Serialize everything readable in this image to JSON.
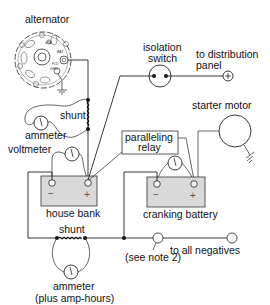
{
  "diagram": {
    "type": "electrical-wiring",
    "colors": {
      "wire": "#222222",
      "battery_fill": "#d9d9d9",
      "background": "#ffffff"
    },
    "labels": {
      "alternator": "alternator",
      "shunt_top": "shunt",
      "ammeter_top": "ammeter",
      "voltmeter": "voltmeter",
      "isolation_switch_1": "isolation",
      "isolation_switch_2": "switch",
      "distribution_1": "to distribution",
      "distribution_2": "panel",
      "starter_motor": "starter motor",
      "relay_1": "paralleling",
      "relay_2": "relay",
      "house_bank": "house bank",
      "cranking_battery": "cranking battery",
      "shunt_bottom": "shunt",
      "ammeter_bottom_1": "ammeter",
      "ammeter_bottom_2": "(plus amp-hours)",
      "see_note": "(see note 2)",
      "all_negatives": "to all negatives",
      "minus": "−",
      "plus": "+",
      "alt_bat": "BAT",
      "alt_fld": "FLD",
      "alt_sta": "STA",
      "alt_gnd": "GND"
    },
    "components": [
      "alternator",
      "shunt (alternator output)",
      "ammeter",
      "voltmeter",
      "isolation switch",
      "distribution panel terminal",
      "paralleling relay",
      "starter motor",
      "house bank",
      "cranking battery",
      "voltmeter (cranking)",
      "shunt (negative)",
      "ammeter (plus amp-hours)",
      "negative bus"
    ]
  }
}
